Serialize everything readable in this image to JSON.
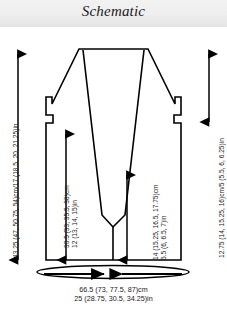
{
  "header": {
    "title": "Schematic"
  },
  "diagram": {
    "shape_name": "garment-schematic-outline",
    "line_color": "#000000",
    "fill_color": "#ffffff",
    "background_color": "#ffffff",
    "header_band_color": "#eeeeee"
  },
  "dimensions": {
    "total_length": {
      "name": "total-length",
      "position": "left",
      "orientation": "vertical",
      "text": "43.25 (47, 50.75, 54)cm/17 (18.5, 20, 21.25)in",
      "cm": "43.25 (47, 50.75, 54)cm",
      "in": "17 (18.5, 20, 21.25)in"
    },
    "armhole_depth": {
      "name": "armhole-depth",
      "position": "right",
      "orientation": "vertical",
      "text": "12.75 (14, 15.25, 16)cm/5 (5.5, 6, 6.25)in",
      "cm": "12.75 (14, 15.25, 16)cm",
      "in": "5 (5.5, 6, 6.25)in"
    },
    "body_length": {
      "name": "body-length",
      "position": "center-left",
      "orientation": "vertical",
      "line1": "30.5 (33, 35.5, 38)cm",
      "line2": "12 (13, 14, 15)in"
    },
    "neck_depth": {
      "name": "neck-depth",
      "position": "center-right",
      "orientation": "vertical",
      "line1": "14 (15.25, 16.5, 17.75)cm",
      "line2": "5.5 (6, 6.5, 7)in"
    },
    "width": {
      "name": "bust-width",
      "position": "bottom",
      "orientation": "horizontal",
      "line1": "66.5 (73, 77.5, 87)cm",
      "line2": "25 (28.75, 30.5, 34.25)in"
    }
  }
}
